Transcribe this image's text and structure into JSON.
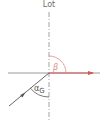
{
  "diagram": {
    "normal_label": "Lot",
    "refracted_angle_label": "β",
    "critical_angle_label": "α",
    "critical_angle_subscript": "G",
    "colors": {
      "interface_line": "#9a9a9a",
      "normal_line": "#8a8a8a",
      "incident_ray": "#555555",
      "refracted_ray": "#d9534f",
      "beta_arc": "#e08a86",
      "alpha_arc": "#555555",
      "label_text": "#6e6e6e"
    }
  }
}
